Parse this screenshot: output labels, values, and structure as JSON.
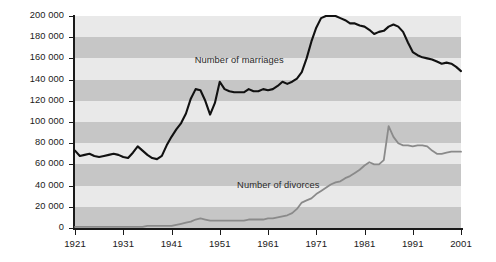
{
  "chart_data": {
    "type": "line",
    "title": "",
    "xlabel": "",
    "ylabel": "",
    "xlim": [
      1921,
      2001
    ],
    "ylim": [
      0,
      200000
    ],
    "grid": "horizontal-bands",
    "legend_position": "inline-annotation",
    "y_ticks": [
      "0",
      "20 000",
      "40 000",
      "60 000",
      "80 000",
      "100 000",
      "120 000",
      "140 000",
      "160 000",
      "180 000",
      "200 000"
    ],
    "y_tick_values": [
      0,
      20000,
      40000,
      60000,
      80000,
      100000,
      120000,
      140000,
      160000,
      180000,
      200000
    ],
    "x_ticks": [
      "1921",
      "1931",
      "1941",
      "1951",
      "1961",
      "1971",
      "1981",
      "1991",
      "2001"
    ],
    "x_tick_values": [
      1921,
      1931,
      1941,
      1951,
      1961,
      1971,
      1981,
      1991,
      2001
    ],
    "x": [
      1921,
      1922,
      1923,
      1924,
      1925,
      1926,
      1927,
      1928,
      1929,
      1930,
      1931,
      1932,
      1933,
      1934,
      1935,
      1936,
      1937,
      1938,
      1939,
      1940,
      1941,
      1942,
      1943,
      1944,
      1945,
      1946,
      1947,
      1948,
      1949,
      1950,
      1951,
      1952,
      1953,
      1954,
      1955,
      1956,
      1957,
      1958,
      1959,
      1960,
      1961,
      1962,
      1963,
      1964,
      1965,
      1966,
      1967,
      1968,
      1969,
      1970,
      1971,
      1972,
      1973,
      1974,
      1975,
      1976,
      1977,
      1978,
      1979,
      1980,
      1981,
      1982,
      1983,
      1984,
      1985,
      1986,
      1987,
      1988,
      1989,
      1990,
      1991,
      1992,
      1993,
      1994,
      1995,
      1996,
      1997,
      1998,
      1999,
      2000,
      2001
    ],
    "series": [
      {
        "name": "Number of marriages",
        "color": "#111111",
        "values": [
          73000,
          68000,
          69000,
          70000,
          68000,
          67000,
          68000,
          69000,
          70000,
          69000,
          67000,
          66000,
          71000,
          77000,
          73000,
          69000,
          66000,
          65000,
          68000,
          78000,
          86000,
          93000,
          99000,
          108000,
          122000,
          131000,
          130000,
          120000,
          107000,
          118000,
          138000,
          131000,
          129000,
          128000,
          128000,
          128000,
          131000,
          129000,
          129000,
          131000,
          130000,
          131000,
          134000,
          138000,
          136000,
          138000,
          141000,
          147000,
          160000,
          176000,
          189000,
          198000,
          200000,
          200000,
          200000,
          198000,
          196000,
          193000,
          193000,
          191000,
          190000,
          187000,
          183000,
          185000,
          186000,
          190000,
          192000,
          190000,
          185000,
          175000,
          166000,
          163000,
          161000,
          160000,
          159000,
          157000,
          155000,
          156000,
          155000,
          152000,
          148000
        ]
      },
      {
        "name": "Number of divorces",
        "color": "#8a8a8a",
        "values": [
          1000,
          1000,
          1000,
          1000,
          1000,
          1000,
          1000,
          1000,
          1000,
          1000,
          1000,
          1000,
          1000,
          1000,
          1000,
          2000,
          2000,
          2000,
          2000,
          2000,
          2000,
          3000,
          4000,
          5000,
          6000,
          8000,
          9000,
          8000,
          7000,
          7000,
          7000,
          7000,
          7000,
          7000,
          7000,
          7000,
          8000,
          8000,
          8000,
          8000,
          9000,
          9000,
          10000,
          11000,
          12000,
          14000,
          18000,
          24000,
          26000,
          28000,
          32000,
          35000,
          38000,
          41000,
          43000,
          44000,
          47000,
          49000,
          52000,
          55000,
          59000,
          62000,
          60000,
          60000,
          64000,
          96000,
          86000,
          80000,
          78000,
          78000,
          77000,
          78000,
          78000,
          77000,
          73000,
          70000,
          70000,
          71000,
          72000,
          72000,
          72000
        ]
      }
    ],
    "annotations": [
      {
        "text": "Number of marriages",
        "x_pct": 0.31,
        "y_value": 158000
      },
      {
        "text": "Number of divorces",
        "x_pct": 0.42,
        "y_value": 40000
      }
    ]
  },
  "plot": {
    "left": 75,
    "top": 16,
    "width": 386,
    "height": 212
  }
}
